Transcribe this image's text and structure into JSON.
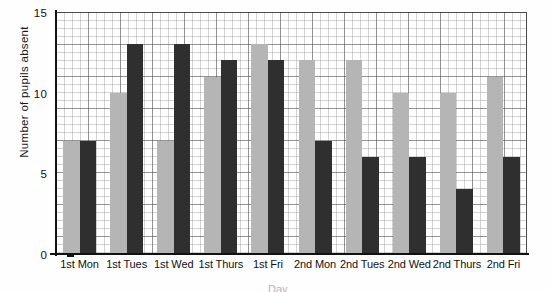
{
  "chart_data": {
    "type": "bar",
    "title": "Number of pupils absent",
    "xlabel": "Day",
    "ylabel": "Number of pupils absent",
    "ylim": [
      0,
      15
    ],
    "yticks": [
      0,
      5,
      10,
      15
    ],
    "grid": true,
    "legend_position": "none",
    "categories": [
      "1st Mon",
      "1st Tues",
      "1st Wed",
      "1st Thurs",
      "1st Fri",
      "2nd Mon",
      "2nd Tues",
      "2nd Wed",
      "2nd Thurs",
      "2nd Fri"
    ],
    "series": [
      {
        "name": "Light bars",
        "color": "#b5b5b5",
        "values": [
          7,
          10,
          7,
          11,
          13,
          12,
          12,
          10,
          10,
          11
        ]
      },
      {
        "name": "Dark bars",
        "color": "#2f2f2f",
        "values": [
          7,
          13,
          13,
          12,
          12,
          7,
          6,
          6,
          4,
          6
        ]
      }
    ]
  },
  "axes": {
    "y_title": "Number of pupils absent",
    "y_tick_labels": [
      "0",
      "5",
      "10",
      "15"
    ],
    "x_title_partial": "Day"
  },
  "title_partial": ""
}
